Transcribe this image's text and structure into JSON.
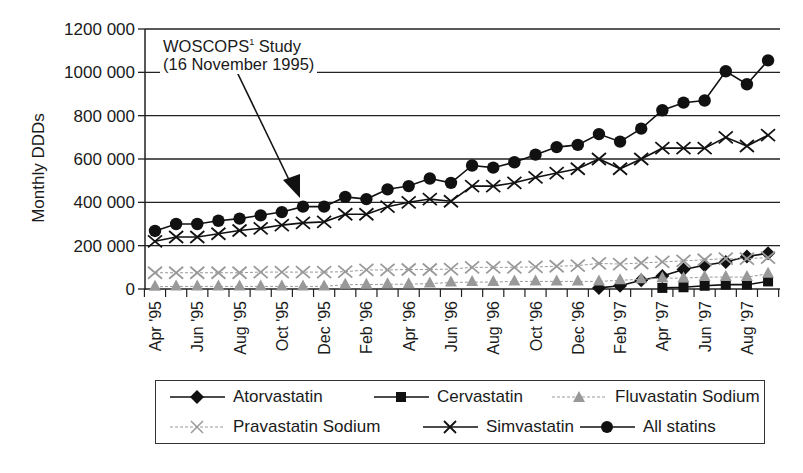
{
  "chart_data": {
    "type": "line",
    "title": "",
    "xlabel": "",
    "ylabel": "Monthly DDDs",
    "ylim": [
      0,
      1200000
    ],
    "yticks": [
      0,
      200000,
      400000,
      600000,
      800000,
      1000000,
      1200000
    ],
    "ytick_labels": [
      "0",
      "200 000",
      "400 000",
      "600 000",
      "800 000",
      "1000 000",
      "1200 000"
    ],
    "grid": "horizontal",
    "legend_position": "bottom",
    "x": [
      "Apr '95",
      "May '95",
      "Jun '95",
      "Jul '95",
      "Aug '95",
      "Sep '95",
      "Oct '95",
      "Nov '95",
      "Dec '95",
      "Jan '96",
      "Feb '96",
      "Mar '96",
      "Apr '96",
      "May '96",
      "Jun '96",
      "Jul '96",
      "Aug '96",
      "Sep '96",
      "Oct '96",
      "Nov '96",
      "Dec '96",
      "Jan '97",
      "Feb '97",
      "Mar '97",
      "Apr '97",
      "May '97",
      "Jun '97",
      "Jul '97",
      "Aug '97",
      "Sep '97"
    ],
    "xtick_labels": [
      "Apr '95",
      "Jun '95",
      "Aug '95",
      "Oct '95",
      "Dec '95",
      "Feb '96",
      "Apr '96",
      "Jun '96",
      "Aug '96",
      "Oct '96",
      "Dec '96",
      "Feb '97",
      "Apr '97",
      "Jun '97",
      "Aug '97"
    ],
    "series": [
      {
        "name": "Atorvastatin",
        "marker": "diamond",
        "color": "#111111",
        "dash": "solid",
        "values": [
          null,
          null,
          null,
          null,
          null,
          null,
          null,
          null,
          null,
          null,
          null,
          null,
          null,
          null,
          null,
          null,
          null,
          null,
          null,
          null,
          null,
          5000,
          15000,
          40000,
          60000,
          90000,
          110000,
          125000,
          150000,
          165000
        ]
      },
      {
        "name": "Cervastatin",
        "marker": "square",
        "color": "#111111",
        "dash": "solid",
        "values": [
          null,
          null,
          null,
          null,
          null,
          null,
          null,
          null,
          null,
          null,
          null,
          null,
          null,
          null,
          null,
          null,
          null,
          null,
          null,
          null,
          null,
          null,
          null,
          null,
          5000,
          8000,
          15000,
          20000,
          20000,
          35000
        ]
      },
      {
        "name": "Fluvastatin Sodium",
        "marker": "triangle",
        "color": "#999999",
        "dash": "dashed",
        "values": [
          10000,
          12000,
          12000,
          12000,
          12000,
          12000,
          12000,
          12000,
          12000,
          20000,
          20000,
          22000,
          22000,
          25000,
          30000,
          32000,
          32000,
          35000,
          35000,
          35000,
          35000,
          35000,
          40000,
          45000,
          50000,
          50000,
          55000,
          55000,
          55000,
          70000
        ]
      },
      {
        "name": "Pravastatin Sodium",
        "marker": "x",
        "color": "#999999",
        "dash": "dashed",
        "values": [
          75000,
          75000,
          75000,
          75000,
          75000,
          78000,
          78000,
          78000,
          78000,
          80000,
          88000,
          88000,
          90000,
          90000,
          92000,
          100000,
          100000,
          100000,
          102000,
          105000,
          108000,
          118000,
          115000,
          120000,
          125000,
          130000,
          135000,
          140000,
          140000,
          145000
        ]
      },
      {
        "name": "Simvastatin",
        "marker": "x",
        "color": "#111111",
        "dash": "solid",
        "values": [
          220000,
          240000,
          240000,
          255000,
          270000,
          280000,
          295000,
          305000,
          310000,
          345000,
          345000,
          380000,
          400000,
          415000,
          405000,
          475000,
          475000,
          490000,
          515000,
          535000,
          555000,
          600000,
          555000,
          600000,
          650000,
          650000,
          650000,
          700000,
          660000,
          710000
        ]
      },
      {
        "name": "All statins",
        "marker": "circle",
        "color": "#111111",
        "dash": "solid",
        "values": [
          268000,
          300000,
          300000,
          315000,
          325000,
          340000,
          355000,
          380000,
          380000,
          425000,
          415000,
          460000,
          475000,
          510000,
          490000,
          570000,
          560000,
          585000,
          620000,
          655000,
          665000,
          715000,
          680000,
          740000,
          825000,
          860000,
          870000,
          1005000,
          945000,
          1055000
        ]
      }
    ],
    "annotations": [
      {
        "text": "WOSCOPS¹ Study (16 November 1995)",
        "points_to": "Nov '95"
      }
    ]
  },
  "annotation": {
    "line1_main": "WOSCOPS",
    "line1_sup": "1",
    "line1_rest": " Study",
    "line2": "(16 November 1995)"
  },
  "legend": {
    "items": [
      {
        "label": "Atorvastatin"
      },
      {
        "label": "Cervastatin"
      },
      {
        "label": "Fluvastatin Sodium"
      },
      {
        "label": "Pravastatin Sodium"
      },
      {
        "label": "Simvastatin"
      },
      {
        "label": "All statins"
      }
    ]
  }
}
